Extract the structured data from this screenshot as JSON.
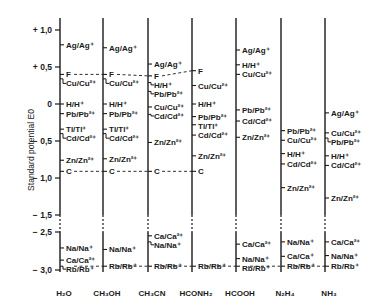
{
  "chart_data": {
    "type": "diagram",
    "title": "",
    "ylabel": "Standard potential E0",
    "y_ticks": [
      "+1,0",
      "+0,5",
      "0",
      "-0,5",
      "-1,0",
      "-1,5",
      "-2,5",
      "-3,0"
    ],
    "y_tick_values": [
      1.0,
      0.5,
      0.0,
      -0.5,
      -1.0,
      -1.5,
      -2.5,
      -3.0
    ],
    "axis_break": {
      "between": [
        -1.5,
        -2.5
      ]
    },
    "solvents": [
      "H2O",
      "CH3OH",
      "CH3CN",
      "HCONH2",
      "HCOOH",
      "N2H4",
      "NH3"
    ],
    "solvent_labels": [
      "H₂O",
      "CH₃OH",
      "CH₃CN",
      "HCONH₂",
      "HCOOH",
      "N₂H₄",
      "NH₃"
    ],
    "reference_lines": [
      {
        "name": "F",
        "solvents": [
          "H2O",
          "CH3OH",
          "CH3CN",
          "HCONH2"
        ],
        "potentials": [
          0.4,
          0.4,
          0.38,
          0.45
        ]
      },
      {
        "name": "C",
        "solvents": [
          "H2O",
          "CH3OH",
          "CH3CN",
          "HCONH2"
        ],
        "potentials": [
          -0.91,
          -0.91,
          -0.91,
          -0.91
        ]
      },
      {
        "name": "Rb",
        "solvents": [
          "H2O",
          "CH3OH",
          "CH3CN",
          "HCONH2",
          "HCOOH",
          "N2H4",
          "NH3"
        ],
        "potentials": [
          -2.95,
          -2.95,
          -2.95,
          -2.95,
          -2.95,
          -2.95,
          -2.95
        ]
      }
    ],
    "series": [
      {
        "name": "H2O",
        "couples": [
          {
            "label": "Ag/Ag⁺",
            "E": 0.8
          },
          {
            "label": "F",
            "E": 0.4
          },
          {
            "label": "Cu/Cu²⁺",
            "E": 0.34
          },
          {
            "label": "H/H⁺",
            "E": 0.0
          },
          {
            "label": "Pb/Pb²⁺",
            "E": -0.13
          },
          {
            "label": "Tl/Tl⁺",
            "E": -0.34
          },
          {
            "label": "Cd/Cd²⁺",
            "E": -0.4
          },
          {
            "label": "Zn/Zn²⁺",
            "E": -0.76
          },
          {
            "label": "C",
            "E": -0.91
          },
          {
            "label": "Na/Na⁺",
            "E": -2.71
          },
          {
            "label": "Ca/Ca²⁺",
            "E": -2.87
          },
          {
            "label": "Rb/Rb⁺",
            "E": -2.95
          }
        ]
      },
      {
        "name": "CH3OH",
        "couples": [
          {
            "label": "Ag/Ag⁺",
            "E": 0.76
          },
          {
            "label": "F",
            "E": 0.4
          },
          {
            "label": "Cu/Cu²⁺",
            "E": 0.34
          },
          {
            "label": "H/H⁺",
            "E": 0.0
          },
          {
            "label": "Pb/Pb²⁺",
            "E": -0.13
          },
          {
            "label": "Tl/Tl⁺",
            "E": -0.34
          },
          {
            "label": "Cd/Cd²⁺",
            "E": -0.4
          },
          {
            "label": "Zn/Zn²⁺",
            "E": -0.74
          },
          {
            "label": "C",
            "E": -0.91
          },
          {
            "label": "Na/Na⁺",
            "E": -2.73
          },
          {
            "label": "Rb/Rb⁺",
            "E": -2.95
          }
        ]
      },
      {
        "name": "CH3CN",
        "couples": [
          {
            "label": "Ag/Ag⁺",
            "E": 0.54
          },
          {
            "label": "F",
            "E": 0.38
          },
          {
            "label": "H/H⁺",
            "E": 0.29
          },
          {
            "label": "Pb/Pb²⁺",
            "E": 0.17
          },
          {
            "label": "Cu/Cu²⁺",
            "E": -0.04
          },
          {
            "label": "Cd/Cd²⁺",
            "E": -0.14
          },
          {
            "label": "Zn/Zn²⁺",
            "E": -0.52
          },
          {
            "label": "C",
            "E": -0.91
          },
          {
            "label": "Ca/Ca²⁺",
            "E": -2.55
          },
          {
            "label": "Na/Na⁺",
            "E": -2.63
          },
          {
            "label": "Rb/Rb⁺",
            "E": -2.95
          }
        ]
      },
      {
        "name": "HCONH2",
        "couples": [
          {
            "label": "F",
            "E": 0.45
          },
          {
            "label": "Cu/Cu²⁺",
            "E": 0.25
          },
          {
            "label": "H/H⁺",
            "E": 0.0
          },
          {
            "label": "Pb/Pb²⁺",
            "E": -0.17
          },
          {
            "label": "Tl/Tl⁺",
            "E": -0.28
          },
          {
            "label": "Cd/Cd²⁺",
            "E": -0.42
          },
          {
            "label": "Zn/Zn²⁺",
            "E": -0.7
          },
          {
            "label": "C",
            "E": -0.91
          },
          {
            "label": "Rb/Rb⁺",
            "E": -2.95
          }
        ]
      },
      {
        "name": "HCOOH",
        "couples": [
          {
            "label": "Ag/Ag⁺",
            "E": 0.73
          },
          {
            "label": "H/H⁺",
            "E": 0.53
          },
          {
            "label": "Cu/Cu²⁺",
            "E": 0.4
          },
          {
            "label": "Pb/Pb²⁺",
            "E": -0.08
          },
          {
            "label": "Cd/Cd²⁺",
            "E": -0.23
          },
          {
            "label": "Zn/Zn²⁺",
            "E": -0.45
          },
          {
            "label": "Ca/Ca²⁺",
            "E": -2.66
          },
          {
            "label": "Na/Na⁺",
            "E": -2.85
          },
          {
            "label": "Rb/Rb⁺",
            "E": -2.95
          }
        ]
      },
      {
        "name": "N2H4",
        "couples": [
          {
            "label": "Pb/Pb²⁺",
            "E": -0.36
          },
          {
            "label": "Cu/Cu²⁺",
            "E": -0.49
          },
          {
            "label": "H/H⁺",
            "E": -0.67
          },
          {
            "label": "Cd/Cd²⁺",
            "E": -0.81
          },
          {
            "label": "Zn/Zn²⁺",
            "E": -1.13
          },
          {
            "label": "Na/Na⁺",
            "E": -2.63
          },
          {
            "label": "Ca/Ca⁺",
            "E": -2.82
          },
          {
            "label": "Rb/Rb⁺",
            "E": -2.95
          }
        ]
      },
      {
        "name": "NH3",
        "couples": [
          {
            "label": "Ag/Ag⁺",
            "E": -0.12
          },
          {
            "label": "Cu/Cu²⁺",
            "E": -0.39
          },
          {
            "label": "Pb/Pb²⁺",
            "E": -0.46
          },
          {
            "label": "H/H⁺",
            "E": -0.7
          },
          {
            "label": "Cd/Cd²⁺",
            "E": -0.83
          },
          {
            "label": "Zn/Zn²⁺",
            "E": -1.27
          },
          {
            "label": "Ca/Ca²⁺",
            "E": -2.63
          },
          {
            "label": "Na/Na⁺",
            "E": -2.81
          },
          {
            "label": "Rb/Rb⁺",
            "E": -2.95
          }
        ]
      }
    ]
  }
}
